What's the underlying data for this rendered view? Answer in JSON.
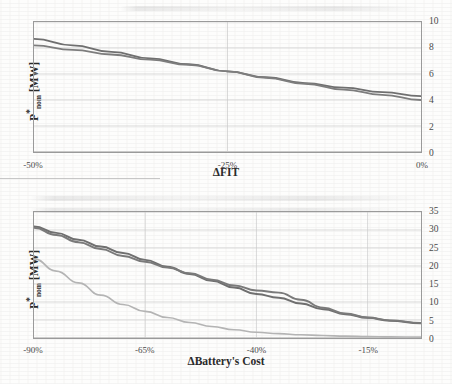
{
  "figure": {
    "background_color": "#fdfdfc",
    "text_color": "#2b2b2b"
  },
  "chart_data": [
    {
      "id": "top",
      "type": "line",
      "title": "",
      "xlabel": "ΔFIT",
      "ylabel": "P*nom [MW]",
      "ylabel_main": "P",
      "ylabel_star": "*",
      "ylabel_sub": "nom",
      "ylabel_unit": " [MW]",
      "xtick_labels": [
        "-50%",
        "-25%",
        "0%"
      ],
      "xtick_values": [
        -50,
        -25,
        0
      ],
      "ytick_labels": [
        "0",
        "2",
        "4",
        "6",
        "8",
        "10"
      ],
      "ytick_values": [
        0,
        2,
        4,
        6,
        8,
        10
      ],
      "xlim": [
        -50,
        0
      ],
      "ylim": [
        0,
        10
      ],
      "grid": true,
      "grid_color": "#c9c9c9",
      "legend": "none",
      "x": [
        -50,
        -45,
        -40,
        -35,
        -30,
        -25,
        -20,
        -15,
        -10,
        -5,
        0
      ],
      "series": [
        {
          "name": "series-1",
          "color": "#6f6f6f",
          "width": 1.8,
          "values": [
            8.7,
            8.2,
            7.7,
            7.2,
            6.75,
            6.2,
            5.75,
            5.3,
            4.95,
            4.6,
            4.3
          ]
        },
        {
          "name": "series-2",
          "color": "#7d7d7d",
          "width": 1.8,
          "values": [
            8.2,
            7.85,
            7.5,
            7.1,
            6.7,
            6.2,
            5.7,
            5.25,
            4.8,
            4.4,
            4.0
          ]
        }
      ]
    },
    {
      "id": "bottom",
      "type": "line",
      "title": "",
      "xlabel": "ΔBattery's Cost",
      "ylabel": "P*nom [MW]",
      "ylabel_main": "P",
      "ylabel_star": "*",
      "ylabel_sub": "nom",
      "ylabel_unit": " [MW]",
      "xtick_labels": [
        "-90%",
        "-65%",
        "-40%",
        "-15%"
      ],
      "xtick_values": [
        -90,
        -65,
        -40,
        -15
      ],
      "ytick_labels": [
        "0",
        "5",
        "10",
        "15",
        "20",
        "25",
        "30",
        "35"
      ],
      "ytick_values": [
        0,
        5,
        10,
        15,
        20,
        25,
        30,
        35
      ],
      "xlim": [
        -90,
        -3
      ],
      "ylim": [
        0,
        35
      ],
      "grid": true,
      "grid_color": "#c9c9c9",
      "legend": "none",
      "x": [
        -90,
        -85,
        -80,
        -75,
        -70,
        -65,
        -60,
        -55,
        -50,
        -45,
        -40,
        -35,
        -30,
        -25,
        -20,
        -15,
        -10,
        -3
      ],
      "series": [
        {
          "name": "series-1",
          "color": "#6f6f6f",
          "width": 2.0,
          "values": [
            31.0,
            29.2,
            27.3,
            25.4,
            23.6,
            21.7,
            19.8,
            17.8,
            15.9,
            14.0,
            12.2,
            11.2,
            9.6,
            8.0,
            6.6,
            5.6,
            4.8,
            4.1
          ]
        },
        {
          "name": "series-2",
          "color": "#7a7a7a",
          "width": 2.0,
          "values": [
            30.6,
            28.6,
            26.6,
            24.7,
            22.8,
            21.2,
            19.6,
            18.0,
            16.2,
            14.6,
            13.2,
            12.6,
            10.6,
            8.4,
            6.8,
            5.7,
            4.9,
            4.2
          ]
        },
        {
          "name": "series-3",
          "color": "#b4b4b4",
          "width": 1.7,
          "values": [
            22.0,
            18.6,
            15.3,
            11.9,
            9.3,
            7.4,
            5.7,
            4.3,
            3.2,
            2.3,
            1.6,
            1.2,
            0.9,
            0.7,
            0.5,
            0.4,
            0.3,
            0.25
          ]
        }
      ]
    }
  ]
}
